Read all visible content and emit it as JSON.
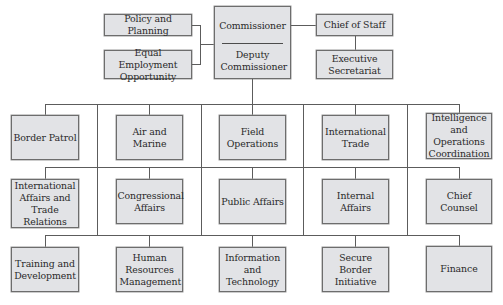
{
  "chart": {
    "title": "",
    "colors": {
      "box_fill": "#e2e3e6",
      "box_border": "#6d6d6d",
      "line": "#5c5c5c"
    },
    "executive": {
      "commissioner": "Commissioner",
      "deputy": "Deputy Commissioner",
      "left_staff": [
        {
          "label": "Policy and Planning"
        },
        {
          "label": "Equal Employment Opportunity"
        }
      ],
      "right_staff": [
        {
          "label": "Chief of Staff"
        },
        {
          "label": "Executive Secretariat"
        }
      ]
    },
    "rows": [
      [
        {
          "label": "Border Patrol"
        },
        {
          "label": "Air and Marine"
        },
        {
          "label": "Field Operations"
        },
        {
          "label": "International Trade"
        },
        {
          "label": "Intelligence and Operations Coordination"
        }
      ],
      [
        {
          "label": "International Affairs and Trade Relations"
        },
        {
          "label": "Congressional Affairs"
        },
        {
          "label": "Public Affairs"
        },
        {
          "label": "Internal Affairs"
        },
        {
          "label": "Chief Counsel"
        }
      ],
      [
        {
          "label": "Training and Development"
        },
        {
          "label": "Human Resources Management"
        },
        {
          "label": "Information and Technology"
        },
        {
          "label": "Secure Border Initiative"
        },
        {
          "label": "Finance"
        }
      ]
    ]
  }
}
